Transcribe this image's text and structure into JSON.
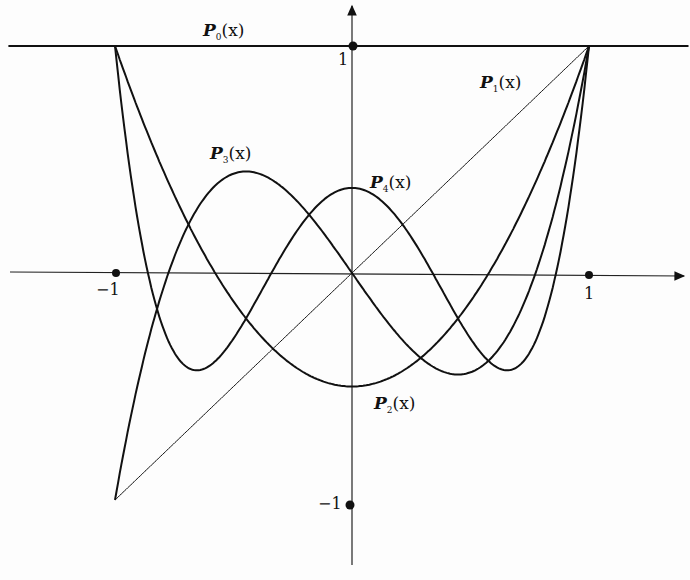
{
  "chart_data": {
    "type": "line",
    "xlabel": "",
    "ylabel": "",
    "xlim": [
      -1.0,
      1.0
    ],
    "ylim": [
      -1.0,
      1.0
    ],
    "grid": false,
    "x_ticks": [
      "-1",
      "1"
    ],
    "y_ticks": [
      "1",
      "-1"
    ],
    "series": [
      {
        "name": "P0(x)",
        "formula": "1"
      },
      {
        "name": "P1(x)",
        "formula": "x"
      },
      {
        "name": "P2(x)",
        "formula": "(3x^2-1)/2"
      },
      {
        "name": "P3(x)",
        "formula": "(5x^3-3x)/2"
      },
      {
        "name": "P4(x)",
        "formula": "(35x^4-30x^2+3)/8"
      }
    ]
  },
  "labels": {
    "p0": {
      "P": "P",
      "sub": "0",
      "arg": "(x)"
    },
    "p1": {
      "P": "P",
      "sub": "1",
      "arg": "(x)"
    },
    "p2": {
      "P": "P",
      "sub": "2",
      "arg": "(x)"
    },
    "p3": {
      "P": "P",
      "sub": "3",
      "arg": "(x)"
    },
    "p4": {
      "P": "P",
      "sub": "4",
      "arg": "(x)"
    },
    "x_neg1": "−1",
    "x_pos1": "1",
    "y_pos1": "1",
    "y_neg1": "−1"
  }
}
